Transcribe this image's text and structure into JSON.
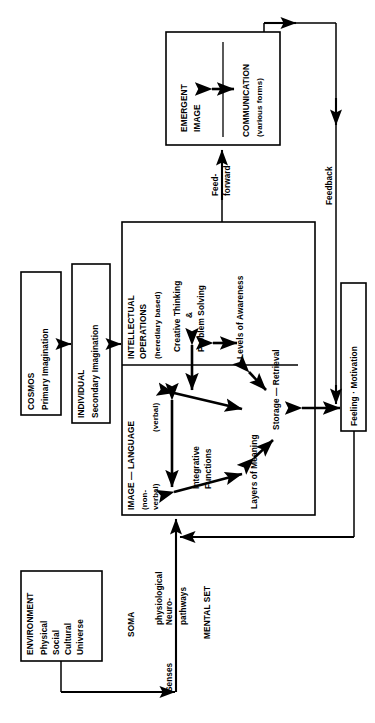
{
  "diagram": {
    "orientation": "rotated-90-ccw",
    "boxes": {
      "environment": {
        "name": "ENVIRONMENT",
        "lines": [
          "ENVIRONMENT",
          "Physical",
          "Social",
          "Cultural",
          "Universe"
        ]
      },
      "cosmos": {
        "name": "COSMOS",
        "lines": [
          "COSMOS",
          "Primary Imagination"
        ]
      },
      "individual": {
        "name": "INDIVIDUAL",
        "lines": [
          "INDIVIDUAL",
          "Secondary Imagination"
        ]
      },
      "intellect": {
        "heading": "INTELLECTUAL",
        "heading2": "OPERATIONS",
        "subheading": "(herediary based)",
        "items": [
          "Creative Thinking",
          "&",
          "Problem Solving",
          "Levels of Awareness",
          "Storage — Retrieval",
          "Layers of Meaning",
          "Integrative",
          "Functions"
        ]
      },
      "image_language": {
        "heading": "IMAGE — LANGUAGE",
        "left_label_line1": "(non-",
        "left_label_line2": "verbal)",
        "right_label": "(verbal)"
      },
      "emergent": {
        "line1": "EMERGENT",
        "line2": "IMAGE"
      },
      "communication": {
        "line1": "COMMUNICATION",
        "line2": "(various forms)"
      },
      "feeling": {
        "label": "Feeling · Motivation"
      }
    },
    "labels": {
      "senses": "Senses",
      "neuro1": "Neuro-",
      "neuro2": "physiological",
      "neuro3": "pathways",
      "soma": "SOMA",
      "mental_set": "MENTAL SET",
      "feed_forward_1": "Feed-",
      "feed_forward_2": "forward",
      "feedback": "Feedback"
    },
    "colors": {
      "stroke": "#000000",
      "background": "#ffffff"
    }
  }
}
